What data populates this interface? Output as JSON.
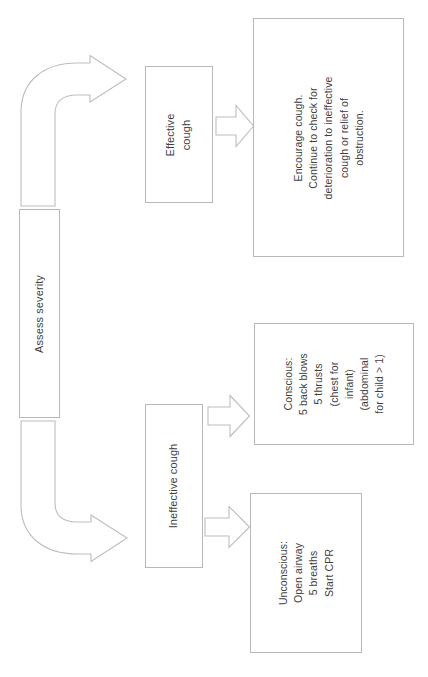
{
  "diagram": {
    "orientation": "rotated-90-ccw",
    "stroke_color": "#b8b8b8",
    "text_color": "#3f3f3f",
    "background_color": "#ffffff",
    "nodes": [
      {
        "id": "assess-severity",
        "label": "Assess severity",
        "shape": "rectangle"
      },
      {
        "id": "effective-cough",
        "label": "Effective\ncough",
        "shape": "rectangle"
      },
      {
        "id": "encourage",
        "label": "Encourage cough.\nContinue to check for\ndeterioration to ineffective\ncough or relief of\nobstruction.",
        "shape": "rectangle"
      },
      {
        "id": "ineffective-cough",
        "label": "Ineffective cough",
        "shape": "rectangle"
      },
      {
        "id": "conscious",
        "label": "Conscious:\n5 back blows\n5 thrusts\n(chest for\ninfant)\n(abdominal\nfor child > 1)",
        "shape": "rectangle"
      },
      {
        "id": "unconscious",
        "label": "Unconscious:\nOpen airway\n5 breaths\nStart CPR",
        "shape": "rectangle"
      }
    ],
    "connectors": [
      {
        "id": "curved-up",
        "from": "assess-severity",
        "to": "effective-cough",
        "style": "curved-block-arrow"
      },
      {
        "id": "curved-down",
        "from": "assess-severity",
        "to": "ineffective-cough",
        "style": "curved-block-arrow"
      },
      {
        "id": "straight-encourage",
        "from": "effective-cough",
        "to": "encourage",
        "style": "block-arrow"
      },
      {
        "id": "straight-conscious",
        "from": "ineffective-cough",
        "to": "conscious",
        "style": "block-arrow"
      },
      {
        "id": "straight-unconscious",
        "from": "ineffective-cough",
        "to": "unconscious",
        "style": "block-arrow"
      }
    ]
  }
}
